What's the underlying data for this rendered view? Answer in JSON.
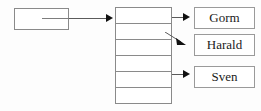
{
  "diagram": {
    "type": "linked-structure",
    "title": "",
    "background_color": "#fdfdfd",
    "stroke_color": "#8a8a8a",
    "arrow_color": "#111111",
    "text_color": "#1a1a1a",
    "pointer_box": {
      "label": "",
      "has_internal_stub_line": true
    },
    "array": {
      "cell_count": 6,
      "cells": [
        {
          "label": ""
        },
        {
          "label": ""
        },
        {
          "label": ""
        },
        {
          "label": ""
        },
        {
          "label": ""
        },
        {
          "label": ""
        }
      ]
    },
    "name_boxes": [
      {
        "label": "Gorm"
      },
      {
        "label": "Harald"
      },
      {
        "label": "Sven"
      }
    ],
    "connectors": [
      {
        "name": "pointer-to-array",
        "style": "horizontal-arrow",
        "from": "pointer-box",
        "to": "array"
      },
      {
        "name": "array-cell-0-to-gorm",
        "style": "horizontal-arrow",
        "from": "array-cell-0",
        "to": "name-box-gorm"
      },
      {
        "name": "array-cell-1-to-harald",
        "style": "diagonal-arrow",
        "from": "array-cell-1",
        "to": "name-box-harald"
      },
      {
        "name": "array-cell-4-to-sven",
        "style": "horizontal-arrow",
        "from": "array-cell-4",
        "to": "name-box-sven"
      }
    ]
  }
}
